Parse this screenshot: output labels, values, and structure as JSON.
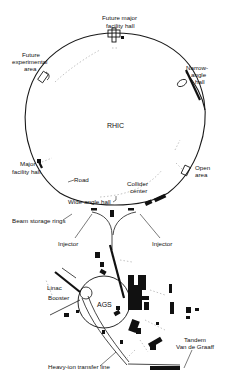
{
  "diagram": {
    "ring_label": "RHIC",
    "labels": {
      "future_major_facility_hall": [
        "Future major",
        "facility hall"
      ],
      "future_experimental_area": [
        "Future",
        "experimental",
        "area"
      ],
      "narrow_angle_hall": [
        "Narrow-",
        "angle",
        "hall"
      ],
      "major_facility_hall": [
        "Major",
        "facility hall"
      ],
      "open_area": [
        "Open",
        "area"
      ],
      "road": "Road",
      "collider_center": [
        "Collider",
        "center"
      ],
      "wide_angle_hall": "Wide-angle hall",
      "beam_storage_rings": "Beam storage rings",
      "injector_left": "Injector",
      "injector_right": "Injector",
      "linac": "Linac",
      "booster": "Booster",
      "ags": "AGS",
      "tandem_van_de_graaff": [
        "Tandem",
        "Van de Graaff"
      ],
      "heavy_ion_transfer_line": "Heavy-ion transfer line"
    },
    "colors": {
      "background": "#ffffff",
      "ink": "#111111"
    }
  }
}
